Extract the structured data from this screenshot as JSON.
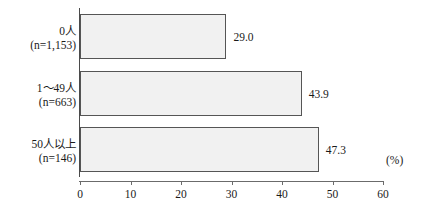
{
  "chart_data": {
    "type": "bar",
    "orientation": "horizontal",
    "title": "",
    "xlabel": "",
    "ylabel": "",
    "unit_label": "(%)",
    "xlim": [
      0,
      60
    ],
    "grid": false,
    "legend": false,
    "categories": [
      "0人\n(n=1,153)",
      "1〜49人\n(n=663)",
      "50人以上\n(n=146)"
    ],
    "category_lines": [
      {
        "line1": "0人",
        "line2": "(n=1,153)"
      },
      {
        "line1": "1〜49人",
        "line2": "(n=663)"
      },
      {
        "line1": "50人以上",
        "line2": "(n=146)"
      }
    ],
    "values": [
      29.0,
      43.9,
      47.3
    ],
    "value_labels": [
      "29.0",
      "43.9",
      "47.3"
    ],
    "xticks": [
      0,
      10,
      20,
      30,
      40,
      50,
      60
    ],
    "xtick_labels": [
      "0",
      "10",
      "20",
      "30",
      "40",
      "50",
      "60"
    ],
    "bar_fill_color": "#f1f1f1",
    "bar_border_color": "#555555",
    "axis_color": "#6b6b6b",
    "text_color": "#1a1a1a"
  }
}
